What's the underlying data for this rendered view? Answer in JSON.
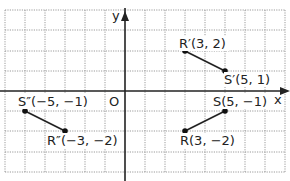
{
  "graph": {
    "x_axis_label": "x",
    "y_axis_label": "y",
    "origin_label": "O",
    "grid": {
      "x_min": -6,
      "x_max": 8,
      "y_min": -4,
      "y_max": 4,
      "spacing_px": 20
    },
    "colors": {
      "grid": "#9a9a9a",
      "axis": "#222222",
      "segment": "#222222",
      "point": "#111111"
    },
    "segments": [
      {
        "name": "RS",
        "from": "R",
        "to": "S"
      },
      {
        "name": "R'S'",
        "from": "R'",
        "to": "S'"
      },
      {
        "name": "R''S''",
        "from": "R''",
        "to": "S''"
      }
    ],
    "points": [
      {
        "id": "R'",
        "label": "R′(3, 2)",
        "x": 3,
        "y": 2
      },
      {
        "id": "S'",
        "label": "S′(5, 1)",
        "x": 5,
        "y": 1
      },
      {
        "id": "S",
        "label": "S(5, −1)",
        "x": 5,
        "y": -1
      },
      {
        "id": "R",
        "label": "R(3, −2)",
        "x": 3,
        "y": -2
      },
      {
        "id": "S''",
        "label": "S″(−5, −1)",
        "x": -5,
        "y": -1
      },
      {
        "id": "R''",
        "label": "R″(−3, −2)",
        "x": -3,
        "y": -2
      }
    ]
  }
}
